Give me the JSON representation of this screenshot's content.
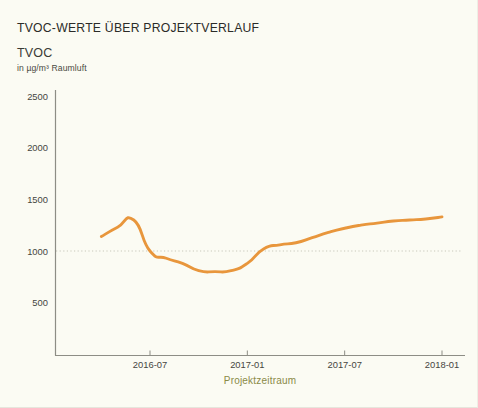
{
  "chart_data": {
    "type": "line",
    "title": "TVOC-WERTE ÜBER PROJEKTVERLAUF",
    "ylabel": "TVOC",
    "yunit": "in µg/m³ Raumluft",
    "xlabel": "Projektzeitraum",
    "series_color": "#e8963c",
    "reference_line": {
      "value": 1000,
      "color": "#c9c9bb",
      "style": "dotted"
    },
    "ylim": [
      0,
      2700
    ],
    "yticks": [
      500,
      1000,
      1500,
      2000,
      2500
    ],
    "ytick_labels": [
      "500",
      "1000",
      "1500",
      "2000",
      "2500"
    ],
    "xlim": [
      "2016-03",
      "2018-02"
    ],
    "xticks": [
      "2016-07",
      "2017-01",
      "2017-07",
      "2018-01"
    ],
    "xtick_labels": [
      "2016-07",
      "2017-01",
      "2017-07",
      "2018-01"
    ],
    "grid": false,
    "legend": "none",
    "x": [
      "2016-04",
      "2016-05",
      "2016-06",
      "2016-07",
      "2016-08",
      "2016-09",
      "2016-10",
      "2016-11",
      "2016-12",
      "2017-01",
      "2017-02",
      "2017-03",
      "2017-04",
      "2017-05",
      "2017-06",
      "2017-07",
      "2017-08",
      "2017-09",
      "2017-10",
      "2017-11",
      "2017-12",
      "2018-01"
    ],
    "values": [
      1140,
      1230,
      1300,
      1000,
      930,
      880,
      810,
      800,
      810,
      880,
      1020,
      1060,
      1080,
      1130,
      1180,
      1220,
      1250,
      1270,
      1290,
      1300,
      1310,
      1330
    ],
    "series": [
      {
        "name": "TVOC",
        "values": [
          1140,
          1230,
          1300,
          1000,
          930,
          880,
          810,
          800,
          810,
          880,
          1020,
          1060,
          1080,
          1130,
          1180,
          1220,
          1250,
          1270,
          1290,
          1300,
          1310,
          1330
        ]
      }
    ]
  }
}
